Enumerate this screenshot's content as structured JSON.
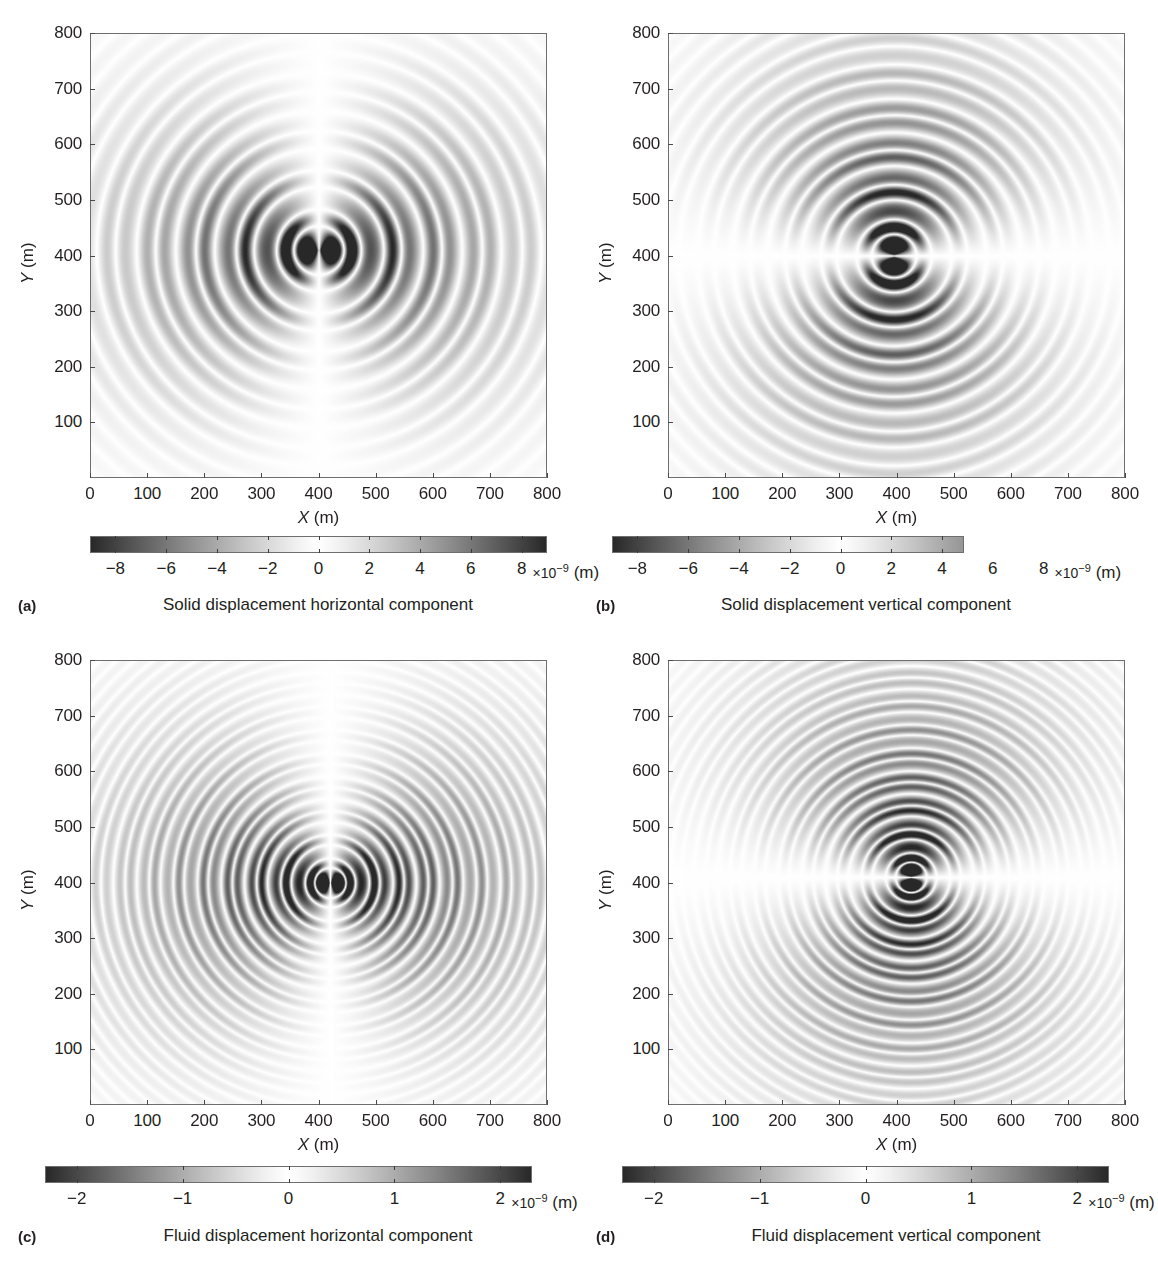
{
  "figure": {
    "axis_titles": {
      "x": "X",
      "y": "Y",
      "unit": "(m)"
    },
    "axis_ticks": {
      "x": [
        "0",
        "100",
        "200",
        "300",
        "400",
        "500",
        "600",
        "700",
        "800"
      ],
      "y": [
        "100",
        "200",
        "300",
        "400",
        "500",
        "600",
        "700",
        "800"
      ]
    },
    "colorbar_units": {
      "multiplier": "×10",
      "exponent": "−9",
      "unit": "(m)"
    }
  },
  "panels": [
    {
      "letter": "(a)",
      "caption": "Solid displacement horizontal component",
      "colorbar_ticks": [
        "−8",
        "−6",
        "−4",
        "−2",
        "0",
        "2",
        "4",
        "6",
        "8"
      ],
      "colorbar_tick_values": [
        -8,
        -6,
        -4,
        -2,
        0,
        2,
        4,
        6,
        8
      ],
      "colorbar_range": [
        -9,
        9
      ],
      "bar_fill_fraction": 1.0
    },
    {
      "letter": "(b)",
      "caption": "Solid displacement vertical component",
      "colorbar_ticks": [
        "−8",
        "−6",
        "−4",
        "−2",
        "0",
        "2",
        "4",
        "6",
        "8"
      ],
      "colorbar_tick_values": [
        -8,
        -6,
        -4,
        -2,
        0,
        2,
        4,
        6,
        8
      ],
      "colorbar_range": [
        -9,
        9
      ],
      "bar_fill_fraction": 0.77
    },
    {
      "letter": "(c)",
      "caption": "Fluid displacement horizontal component",
      "colorbar_ticks": [
        "−2",
        "−1",
        "0",
        "1",
        "2"
      ],
      "colorbar_tick_values": [
        -2,
        -1,
        0,
        1,
        2
      ],
      "colorbar_range": [
        -2.3,
        2.3
      ],
      "bar_fill_fraction": 1.0
    },
    {
      "letter": "(d)",
      "caption": "Fluid displacement vertical component",
      "colorbar_ticks": [
        "−2",
        "−1",
        "0",
        "1",
        "2"
      ],
      "colorbar_tick_values": [
        -2,
        -1,
        0,
        1,
        2
      ],
      "colorbar_range": [
        -2.3,
        2.3
      ],
      "bar_fill_fraction": 1.0
    }
  ],
  "chart_data": [
    {
      "type": "heatmap",
      "panel": "a",
      "title": "Solid displacement horizontal component",
      "xlabel": "X (m)",
      "ylabel": "Y (m)",
      "xlim": [
        0,
        800
      ],
      "ylim": [
        0,
        800
      ],
      "xticks": [
        0,
        100,
        200,
        300,
        400,
        500,
        600,
        700,
        800
      ],
      "yticks": [
        100,
        200,
        300,
        400,
        500,
        600,
        700,
        800
      ],
      "colorbar_label": "×10⁻⁹ (m)",
      "clim": [
        -9,
        9
      ],
      "cmap": "gray-wrap",
      "source_xy": [
        400,
        410
      ],
      "wavefield": {
        "pattern": "horizontal-dipole radial wavetrain",
        "lobe_axis": "x",
        "wavelength_m": 70,
        "n_visible_rings": 6,
        "peak_amplitude": 9,
        "amplitude_decay": "1/r"
      }
    },
    {
      "type": "heatmap",
      "panel": "b",
      "title": "Solid displacement vertical component",
      "xlabel": "X (m)",
      "ylabel": "Y (m)",
      "xlim": [
        0,
        800
      ],
      "ylim": [
        0,
        800
      ],
      "xticks": [
        0,
        100,
        200,
        300,
        400,
        500,
        600,
        700,
        800
      ],
      "yticks": [
        100,
        200,
        300,
        400,
        500,
        600,
        700,
        800
      ],
      "colorbar_label": "×10⁻⁹ (m)",
      "clim": [
        -9,
        9
      ],
      "cmap": "gray-wrap",
      "source_xy": [
        395,
        400
      ],
      "wavefield": {
        "pattern": "vertical-dipole radial wavetrain",
        "lobe_axis": "y",
        "wavelength_m": 62,
        "n_visible_rings": 7,
        "peak_amplitude": 9,
        "amplitude_decay": "1/r"
      }
    },
    {
      "type": "heatmap",
      "panel": "c",
      "title": "Fluid displacement horizontal component",
      "xlabel": "X (m)",
      "ylabel": "Y (m)",
      "xlim": [
        0,
        800
      ],
      "ylim": [
        0,
        800
      ],
      "xticks": [
        0,
        100,
        200,
        300,
        400,
        500,
        600,
        700,
        800
      ],
      "yticks": [
        100,
        200,
        300,
        400,
        500,
        600,
        700,
        800
      ],
      "colorbar_label": "×10⁻⁹ (m)",
      "clim": [
        -2.3,
        2.3
      ],
      "cmap": "gray-wrap",
      "source_xy": [
        420,
        400
      ],
      "wavefield": {
        "pattern": "horizontal-dipole fine concentric rings",
        "lobe_axis": "x",
        "wavelength_m": 42,
        "n_visible_rings": 11,
        "peak_amplitude": 2.3,
        "amplitude_decay": "1/r"
      }
    },
    {
      "type": "heatmap",
      "panel": "d",
      "title": "Fluid displacement vertical component",
      "xlabel": "X (m)",
      "ylabel": "Y (m)",
      "xlim": [
        0,
        800
      ],
      "ylim": [
        0,
        800
      ],
      "xticks": [
        0,
        100,
        200,
        300,
        400,
        500,
        600,
        700,
        800
      ],
      "yticks": [
        100,
        200,
        300,
        400,
        500,
        600,
        700,
        800
      ],
      "colorbar_label": "×10⁻⁹ (m)",
      "clim": [
        -2.3,
        2.3
      ],
      "cmap": "gray-wrap",
      "source_xy": [
        425,
        410
      ],
      "wavefield": {
        "pattern": "vertical-dipole fine concentric rings",
        "lobe_axis": "y",
        "wavelength_m": 42,
        "n_visible_rings": 11,
        "peak_amplitude": 2.3,
        "amplitude_decay": "1/r"
      }
    }
  ]
}
